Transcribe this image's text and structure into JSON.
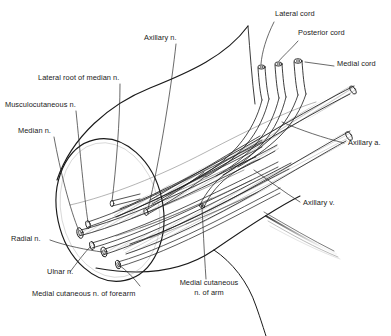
{
  "figure": {
    "width": 391,
    "height": 336,
    "background": "#ffffff",
    "ink_color": "#1a1a1a",
    "style": "line-drawing"
  },
  "labels": {
    "lateral_cord": "Lateral cord",
    "posterior_cord": "Posterior cord",
    "medial_cord": "Medial cord",
    "axillary_n": "Axillary n.",
    "lateral_root_of_median_n": "Lateral root of median n.",
    "musculocutaneous_n": "Musculocutaneous n.",
    "median_n": "Median n.",
    "radial_n": "Radial n.",
    "ulnar_n": "Ulnar n.",
    "medial_cutaneous_n_of_forearm": "Medial cutaneous n. of forearm",
    "medial_cutaneous_n_of_arm_line1": "Medial cutaneous",
    "medial_cutaneous_n_of_arm_line2": "n. of arm",
    "axillary_a": "Axillary a.",
    "axillary_v": "Axillary v."
  },
  "structures": [
    {
      "name": "lateral-cord",
      "kind": "nerve-cord"
    },
    {
      "name": "posterior-cord",
      "kind": "nerve-cord"
    },
    {
      "name": "medial-cord",
      "kind": "nerve-cord"
    },
    {
      "name": "axillary-nerve",
      "kind": "nerve"
    },
    {
      "name": "lateral-root-of-median-nerve",
      "kind": "nerve"
    },
    {
      "name": "musculocutaneous-nerve",
      "kind": "nerve"
    },
    {
      "name": "median-nerve",
      "kind": "nerve"
    },
    {
      "name": "radial-nerve",
      "kind": "nerve"
    },
    {
      "name": "ulnar-nerve",
      "kind": "nerve"
    },
    {
      "name": "medial-cutaneous-nerve-of-forearm",
      "kind": "nerve"
    },
    {
      "name": "medial-cutaneous-nerve-of-arm",
      "kind": "nerve"
    },
    {
      "name": "axillary-artery",
      "kind": "artery"
    },
    {
      "name": "axillary-vein",
      "kind": "vein"
    },
    {
      "name": "arm-cut-surface",
      "kind": "cross-section"
    },
    {
      "name": "arm-outline",
      "kind": "limb-contour"
    },
    {
      "name": "fascial-sheet",
      "kind": "fascia"
    }
  ]
}
